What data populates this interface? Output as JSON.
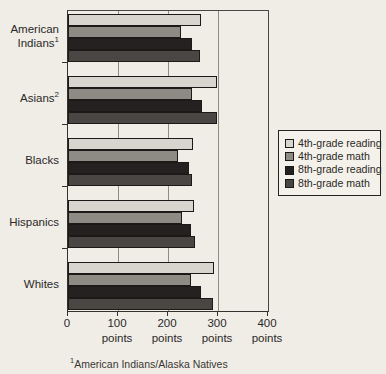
{
  "chart_data": {
    "type": "bar",
    "orientation": "horizontal",
    "title": "",
    "xlabel": "points",
    "xlim": [
      0,
      400
    ],
    "grid": true,
    "categories": [
      {
        "label": "American Indians",
        "footnote_mark": "1"
      },
      {
        "label": "Asians",
        "footnote_mark": "2"
      },
      {
        "label": "Blacks",
        "footnote_mark": ""
      },
      {
        "label": "Hispanics",
        "footnote_mark": ""
      },
      {
        "label": "Whites",
        "footnote_mark": ""
      }
    ],
    "series": [
      {
        "name": "4th-grade reading",
        "color": "#d8d5cf",
        "values": [
          265,
          298,
          250,
          252,
          291
        ]
      },
      {
        "name": "4th-grade math",
        "color": "#8e8b85",
        "values": [
          225,
          247,
          220,
          227,
          245
        ]
      },
      {
        "name": "8th-grade reading",
        "color": "#242120",
        "values": [
          248,
          267,
          241,
          245,
          266
        ]
      },
      {
        "name": "8th-grade math",
        "color": "#4a4643",
        "values": [
          263,
          297,
          247,
          253,
          290
        ]
      }
    ],
    "xticks": [
      {
        "value": 0,
        "label": "0",
        "unit": ""
      },
      {
        "value": 100,
        "label": "100",
        "unit": "points"
      },
      {
        "value": 200,
        "label": "200",
        "unit": "points"
      },
      {
        "value": 300,
        "label": "300",
        "unit": "points"
      },
      {
        "value": 400,
        "label": "400",
        "unit": "points"
      }
    ],
    "legend": {
      "position": "right"
    },
    "footnote": {
      "mark": "1",
      "text": "American Indians/Alaska Natives"
    }
  }
}
